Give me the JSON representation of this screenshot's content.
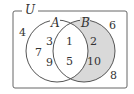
{
  "diagram": {
    "type": "venn",
    "universe_label": "U",
    "sets": [
      {
        "label": "A",
        "elements_only": [
          "3",
          "7",
          "9"
        ]
      },
      {
        "label": "B",
        "elements_only": [
          "2",
          "10"
        ]
      }
    ],
    "intersection": [
      "1",
      "5"
    ],
    "outside": [
      "4",
      "6",
      "8"
    ],
    "shaded_region": "B only (B − A)",
    "shade_color": "#d9d9d9",
    "stroke_color": "#555555"
  },
  "labels": {
    "U": "U",
    "A": "A",
    "B": "B",
    "n3": "3",
    "n7": "7",
    "n9": "9",
    "n1": "1",
    "n5": "5",
    "n2": "2",
    "n10": "10",
    "n4": "4",
    "n6": "6",
    "n8": "8"
  }
}
